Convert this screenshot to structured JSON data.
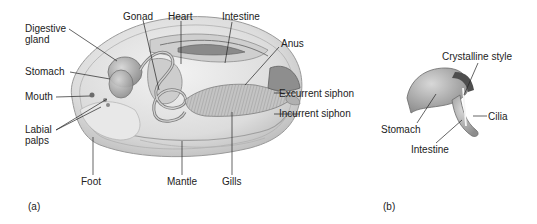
{
  "figure_a": {
    "panel_label": "(a)",
    "labels": {
      "digestive_gland_1": "Digestive",
      "digestive_gland_2": "gland",
      "gonad": "Gonad",
      "heart": "Heart",
      "intestine": "Intestine",
      "anus": "Anus",
      "stomach": "Stomach",
      "mouth": "Mouth",
      "excurrent_siphon": "Excurrent siphon",
      "incurrent_siphon": "Incurrent siphon",
      "labial_palps_1": "Labial",
      "labial_palps_2": "palps",
      "foot": "Foot",
      "mantle": "Mantle",
      "gills": "Gills"
    }
  },
  "figure_b": {
    "panel_label": "(b)",
    "labels": {
      "crystalline_style": "Crystalline style",
      "stomach": "Stomach",
      "cilia": "Cilia",
      "intestine": "Intestine"
    }
  },
  "colors": {
    "shell": "#e4e4e4",
    "shell_edge": "#9a9a9a",
    "organ": "#b5b5b5",
    "organ_dark": "#7a7a7a",
    "leader": "#222222"
  }
}
